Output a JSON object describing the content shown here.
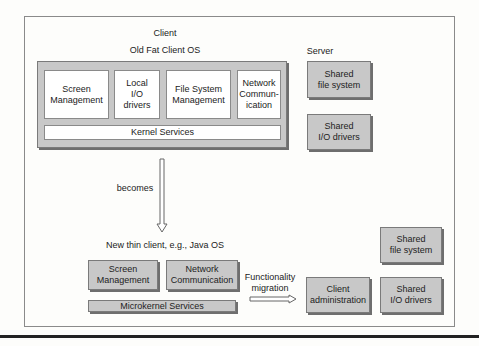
{
  "diagram": {
    "title": "Client",
    "old_os_label": "Old Fat Client OS",
    "server_label": "Server",
    "old_client_modules": [
      "Screen\nManagement",
      "Local\nI/O\ndrivers",
      "File System\nManagement",
      "Network\nCommun-\nication"
    ],
    "kernel_label": "Kernel Services",
    "server_modules": [
      "Shared\nfile system",
      "Shared\nI/O drivers"
    ],
    "transition_label": "becomes",
    "new_client_label": "New thin client, e.g., Java OS",
    "new_client_modules": [
      "Screen\nManagement",
      "Network\nCommunication"
    ],
    "microkernel_label": "Microkernel Services",
    "migration_label": "Functionality\nmigration",
    "new_server_modules": [
      "Client\nadministration",
      "Shared\nfile system",
      "Shared\nI/O drivers"
    ],
    "colors": {
      "module_gray": "#c8c8c8",
      "frame_border": "#8a8a8a",
      "background": "#fdfdfb"
    }
  }
}
